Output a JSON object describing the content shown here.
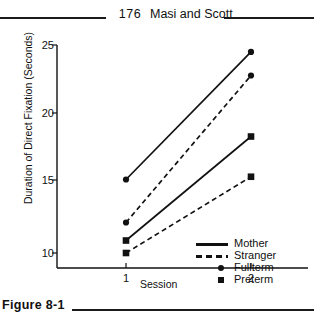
{
  "running_head": {
    "folio": "176",
    "title": "Masi and Scott"
  },
  "caption": {
    "number": "Figure 8-1"
  },
  "chart_data": {
    "type": "line",
    "title": "",
    "xlabel": "Session",
    "ylabel": "Duration of Direct Fixation (Seconds)",
    "x": [
      1,
      2
    ],
    "xticklabels": [
      "1",
      "2"
    ],
    "yticks": [
      10,
      15,
      20,
      25
    ],
    "yticklabels": [
      "10",
      "15",
      "20",
      "25"
    ],
    "ylim": [
      8.5,
      25
    ],
    "xlim": [
      0.55,
      2.45
    ],
    "grid": false,
    "legend_position": "lower right",
    "series": [
      {
        "name": "Fullterm - Mother",
        "group": "Fullterm",
        "condition": "Mother",
        "linestyle": "solid",
        "marker": "circle",
        "values": [
          15.3,
          24.5
        ]
      },
      {
        "name": "Fullterm - Stranger",
        "group": "Fullterm",
        "condition": "Stranger",
        "linestyle": "dashed",
        "marker": "circle",
        "values": [
          12.2,
          22.8
        ]
      },
      {
        "name": "Preterm - Mother",
        "group": "Preterm",
        "condition": "Mother",
        "linestyle": "solid",
        "marker": "square",
        "values": [
          10.9,
          18.4
        ]
      },
      {
        "name": "Preterm - Stranger",
        "group": "Preterm",
        "condition": "Stranger",
        "linestyle": "dashed",
        "marker": "square",
        "values": [
          10.0,
          15.5
        ]
      }
    ],
    "legend": [
      {
        "label": "Mother",
        "key": "solid-line"
      },
      {
        "label": "Stranger",
        "key": "dashed-line"
      },
      {
        "label": "Fullterm",
        "key": "circle-marker"
      },
      {
        "label": "Preterm",
        "key": "square-marker"
      }
    ]
  },
  "colors": {
    "ink": "#111111",
    "rule": "#1b1b1b",
    "background": "#ffffff"
  }
}
